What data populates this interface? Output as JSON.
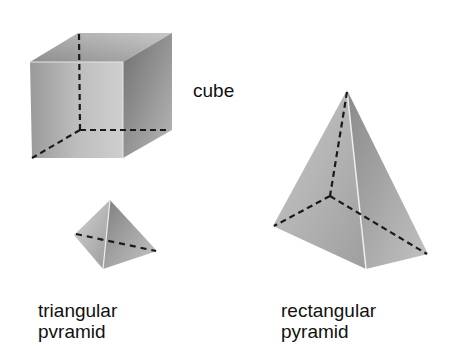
{
  "figure": {
    "shapes": [
      {
        "id": "cube",
        "label": "cube"
      },
      {
        "id": "triangular-pyramid",
        "label_line1": "triangular",
        "label_line2": "pvramid"
      },
      {
        "id": "rectangular-pyramid",
        "label_line1": "rectangular",
        "label_line2": "pyramid"
      }
    ],
    "colors": {
      "background": "#ffffff",
      "face_light": "#d6d6d6",
      "face_mid": "#b0b0b0",
      "face_dark": "#8c8c8c",
      "hidden_edge": "#1a1a1a",
      "text": "#111111"
    }
  }
}
